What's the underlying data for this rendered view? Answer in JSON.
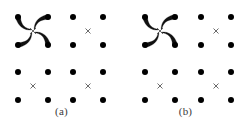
{
  "figure": {
    "type": "diagram",
    "background_color": "#ffffff",
    "width": 247,
    "height": 128,
    "dot_color": "#000000",
    "cross_color": "#5a5a5a",
    "arrow_color": "#111111",
    "label_color": "#3a3a3a"
  },
  "panels": [
    {
      "id": "a",
      "label": "(a)",
      "origin_x": 0,
      "lattice": {
        "rows": 4,
        "cols": 4,
        "dot_radius": 3.0,
        "x_positions": [
          18,
          48,
          73,
          103
        ],
        "y_positions": [
          17,
          45,
          72,
          100
        ]
      },
      "crosses": [
        {
          "name": "cross-top-left",
          "x": 33,
          "y": 31,
          "size": 6.0
        },
        {
          "name": "cross-top-right",
          "x": 88,
          "y": 31,
          "size": 5.0
        },
        {
          "name": "cross-bottom-left",
          "x": 33,
          "y": 86,
          "size": 5.0
        },
        {
          "name": "cross-bottom-right",
          "x": 88,
          "y": 86,
          "size": 5.0
        }
      ],
      "arrows": {
        "converge_point": {
          "x": 33,
          "y": 31
        },
        "count": 4,
        "from_dots": [
          {
            "x": 18,
            "y": 17
          },
          {
            "x": 48,
            "y": 17
          },
          {
            "x": 18,
            "y": 45
          },
          {
            "x": 48,
            "y": 45
          }
        ],
        "curvature": "outward-bulging",
        "bulge": 7.5,
        "tapered": true
      }
    },
    {
      "id": "b",
      "label": "(b)",
      "origin_x": 124,
      "lattice": {
        "rows": 4,
        "cols": 4,
        "dot_radius": 3.0,
        "x_positions": [
          21,
          51,
          77,
          107
        ],
        "y_positions": [
          17,
          45,
          72,
          100
        ]
      },
      "crosses": [
        {
          "name": "cross-top-left",
          "x": 36,
          "y": 31,
          "size": 6.0
        },
        {
          "name": "cross-top-right",
          "x": 92,
          "y": 31,
          "size": 5.0
        },
        {
          "name": "cross-bottom-left",
          "x": 36,
          "y": 86,
          "size": 5.0
        },
        {
          "name": "cross-bottom-right",
          "x": 92,
          "y": 86,
          "size": 5.0
        }
      ],
      "arrows": {
        "converge_point": {
          "x": 36,
          "y": 31
        },
        "count": 4,
        "from_dots": [
          {
            "x": 21,
            "y": 17
          },
          {
            "x": 51,
            "y": 17
          },
          {
            "x": 21,
            "y": 45
          },
          {
            "x": 51,
            "y": 45
          }
        ],
        "curvature": "outward-bulging",
        "bulge": 7.5,
        "tapered": true
      }
    }
  ]
}
